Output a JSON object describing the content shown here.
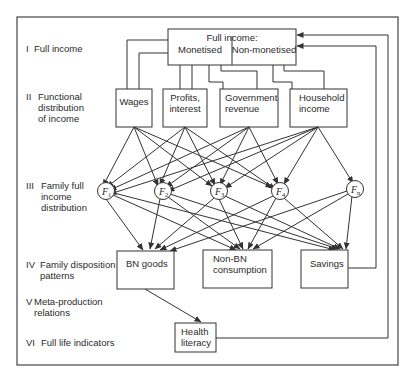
{
  "levels": [
    {
      "numeral": "I",
      "lines": [
        "Full income"
      ]
    },
    {
      "numeral": "II",
      "lines": [
        "Functional",
        "distribution",
        "of income"
      ]
    },
    {
      "numeral": "III",
      "lines": [
        "Family full",
        "income",
        "distribution"
      ]
    },
    {
      "numeral": "IV",
      "lines": [
        "Family disposition",
        "patterns"
      ]
    },
    {
      "numeral": "V",
      "lines": [
        "Meta-production",
        "relations"
      ]
    },
    {
      "numeral": "VI",
      "lines": [
        "Full life indicators"
      ]
    }
  ],
  "full_income": {
    "title": "Full income:",
    "left": "Monetised",
    "right": "Non-monetised"
  },
  "functional": [
    {
      "id": "wages",
      "lines": [
        "Wages"
      ]
    },
    {
      "id": "profits",
      "lines": [
        "Profits,",
        "interest"
      ]
    },
    {
      "id": "government",
      "lines": [
        "Government",
        "revenue"
      ]
    },
    {
      "id": "household",
      "lines": [
        "Household",
        "income"
      ]
    }
  ],
  "families": [
    {
      "id": "f1",
      "letter": "F",
      "sub": "1"
    },
    {
      "id": "f2",
      "letter": "F",
      "sub": "2"
    },
    {
      "id": "f3",
      "letter": "F",
      "sub": "3"
    },
    {
      "id": "f4",
      "letter": "F",
      "sub": "4"
    },
    {
      "id": "fn",
      "letter": "F",
      "sub": "n"
    }
  ],
  "dispositions": [
    {
      "id": "bn",
      "lines": [
        "BN goods"
      ]
    },
    {
      "id": "nonbn",
      "lines": [
        "Non-BN",
        "consumption"
      ]
    },
    {
      "id": "savings",
      "lines": [
        "Savings"
      ]
    }
  ],
  "indicator": {
    "id": "health",
    "lines": [
      "Health",
      "literacy"
    ]
  }
}
